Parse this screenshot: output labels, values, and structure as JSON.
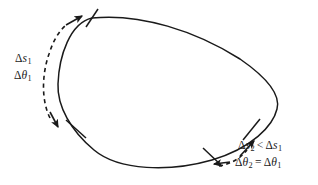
{
  "figure": {
    "type": "geometry-diagram",
    "background_color": "#ffffff",
    "stroke_color": "#1a1a1a",
    "curve": {
      "name": "closed-convex-curve",
      "style": "solid",
      "stroke_width": 1.4,
      "path": "M 92,18 C 140,13 196,30 240,58 C 268,77 280,94 277,108 C 274,125 253,148 212,160 C 170,172 120,171 94,150 C 70,131 57,106 58,84 C 59,55 70,24 92,18 Z"
    },
    "arc_left": {
      "name": "left-measured-arc",
      "from_tick": "tick-top",
      "to_tick": "tick-bottom-left",
      "arc_label": "Δs₁",
      "angle_label": "Δθ₁",
      "dashed_guide": true
    },
    "arc_right": {
      "name": "right-measured-arc",
      "from_tick": "tick-right-lower",
      "to_tick": "tick-right-upper",
      "arc_label": "Δs₂",
      "angle_label": "Δθ₂",
      "dashed_guide": true
    },
    "ticks": [
      {
        "name": "tick-top",
        "x": 92,
        "y": 18,
        "angle_deg": 62
      },
      {
        "name": "tick-bottom-left",
        "x": 76,
        "y": 129,
        "angle_deg": 28
      },
      {
        "name": "tick-right-lower",
        "x": 213,
        "y": 156,
        "angle_deg": 118
      },
      {
        "name": "tick-right-upper",
        "x": 252,
        "y": 129,
        "angle_deg": 148
      }
    ],
    "labels": {
      "delta_s_1": {
        "delta": "Δ",
        "var": "s",
        "sub": "1"
      },
      "delta_theta_1": {
        "delta": "Δ",
        "var": "θ",
        "sub": "1"
      },
      "relation_s": {
        "left_delta": "Δ",
        "left_var": "s",
        "left_sub": "2",
        "operator": "<",
        "right_delta": "Δ",
        "right_var": "s",
        "right_sub": "1"
      },
      "relation_theta": {
        "left_delta": "Δ",
        "left_var": "θ",
        "left_sub": "2",
        "operator": "=",
        "right_delta": "Δ",
        "right_var": "θ",
        "right_sub": "1"
      }
    }
  }
}
